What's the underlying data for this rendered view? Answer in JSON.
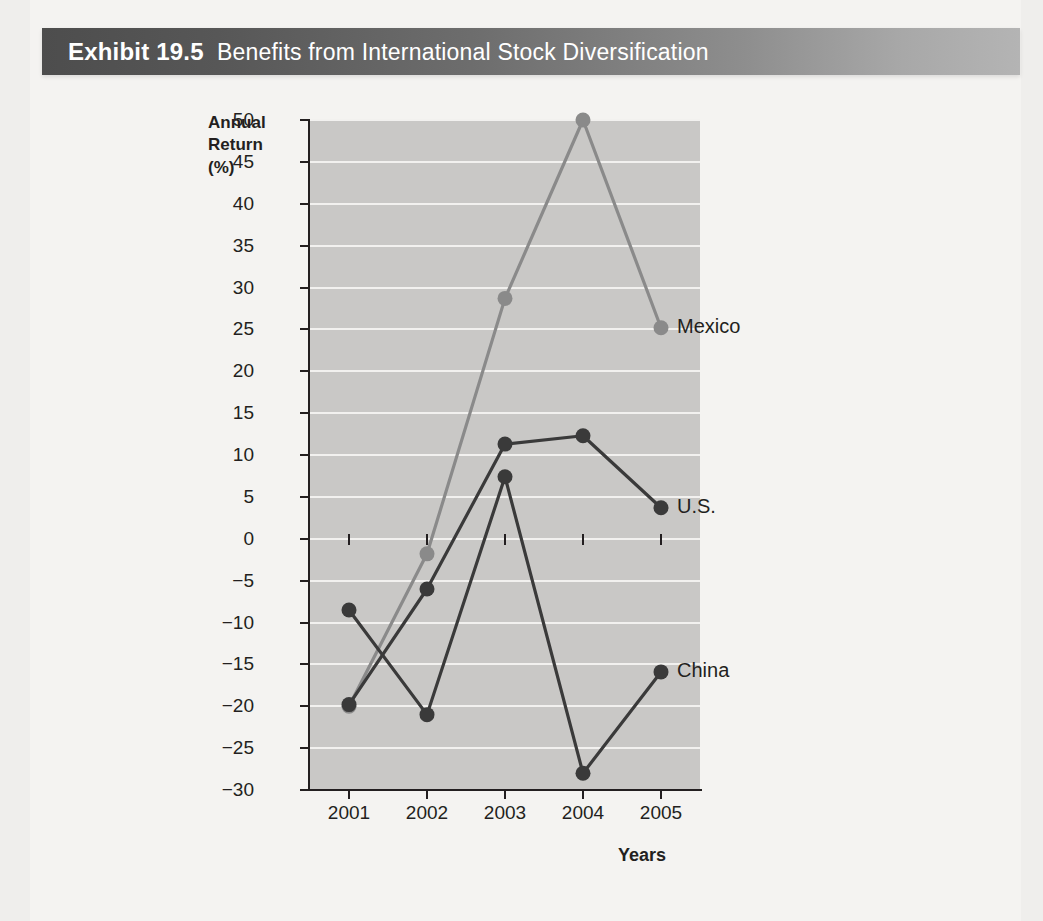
{
  "banner": {
    "exhibit_number": "Exhibit 19.5",
    "caption": "Benefits from International Stock Diversification"
  },
  "axis": {
    "y_title_line1": "Annual",
    "y_title_line2": "Return",
    "y_title_line3": "(%)",
    "x_title": "Years"
  },
  "colors": {
    "banner_dark": "#4d4d4d",
    "banner_light": "#b4b4b4",
    "plot_background": "#c9c8c6",
    "gridline": "#f2f1ef",
    "axis": "#231f20",
    "mexico": "#8a8a8a",
    "us": "#3a3a3a",
    "china": "#3a3a3a",
    "page": "#f4f3f1"
  },
  "chart_data": {
    "type": "line",
    "title": "Benefits from International Stock Diversification",
    "xlabel": "Years",
    "ylabel": "Annual Return (%)",
    "categories": [
      "2001",
      "2002",
      "2003",
      "2004",
      "2005"
    ],
    "x": [
      2001,
      2002,
      2003,
      2004,
      2005
    ],
    "ylim": [
      -30,
      50
    ],
    "ytick_step": 5,
    "yticks": [
      50,
      45,
      40,
      35,
      30,
      25,
      20,
      15,
      10,
      5,
      0,
      -5,
      -10,
      -15,
      -20,
      -25,
      -30
    ],
    "ytick_labels": [
      "50",
      "45",
      "40",
      "35",
      "30",
      "25",
      "20",
      "15",
      "10",
      "5",
      "0",
      "−5",
      "−10",
      "−15",
      "−20",
      "−25",
      "−30"
    ],
    "grid": true,
    "grid_axis": "y",
    "legend": "inline-right-end-labels",
    "markers": true,
    "series": [
      {
        "name": "Mexico",
        "color": "#8a8a8a",
        "values": [
          -20.0,
          -1.8,
          28.7,
          50.0,
          25.2
        ]
      },
      {
        "name": "U.S.",
        "color": "#3a3a3a",
        "values": [
          -19.8,
          -6.0,
          11.3,
          12.3,
          3.7
        ]
      },
      {
        "name": "China",
        "color": "#3a3a3a",
        "values": [
          -8.5,
          -21.0,
          7.4,
          -28.0,
          -15.9
        ]
      }
    ]
  }
}
